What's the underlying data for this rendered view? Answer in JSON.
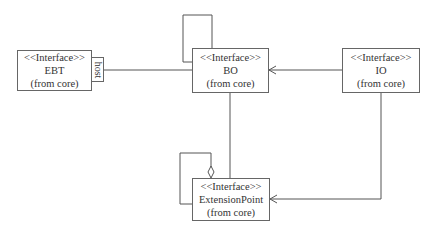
{
  "diagram": {
    "type": "uml-class-diagram",
    "classes": [
      {
        "id": "ebt",
        "stereotype": "<<Interface>>",
        "name": "EBT",
        "package": "(from core)"
      },
      {
        "id": "bo",
        "stereotype": "<<Interface>>",
        "name": "BO",
        "package": "(from core)"
      },
      {
        "id": "io",
        "stereotype": "<<Interface>>",
        "name": "IO",
        "package": "(from core)"
      },
      {
        "id": "ep",
        "stereotype": "<<Interface>>",
        "name": "ExtensionPoint",
        "package": "(from core)"
      }
    ],
    "qualifier": {
      "owner": "ebt",
      "label": "host"
    },
    "relations": [
      {
        "from": "ebt",
        "to": "bo",
        "kind": "qualified-association",
        "qualifier": "host"
      },
      {
        "from": "bo",
        "to": "bo",
        "kind": "self-association"
      },
      {
        "from": "io",
        "to": "bo",
        "kind": "directed-association"
      },
      {
        "from": "bo",
        "to": "ep",
        "kind": "association"
      },
      {
        "from": "io",
        "to": "ep",
        "kind": "directed-association"
      },
      {
        "from": "ep",
        "to": "ep",
        "kind": "self-aggregation"
      }
    ]
  }
}
